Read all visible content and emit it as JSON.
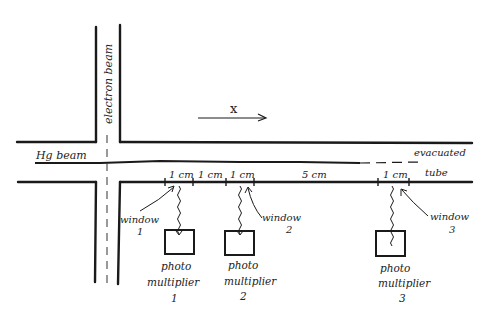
{
  "diagram": {
    "type": "apparatus-sketch",
    "labels": {
      "electron_beam": "electron beam",
      "hg_beam": "Hg beam",
      "direction": "x",
      "evacuated": "evacuated",
      "tube": "tube"
    },
    "distances": [
      {
        "label": "1 cm"
      },
      {
        "label": "1 cm"
      },
      {
        "label": "1 cm"
      },
      {
        "label": "5 cm"
      },
      {
        "label": "1 cm"
      }
    ],
    "windows": [
      {
        "label": "window",
        "num": "1"
      },
      {
        "label": "window",
        "num": "2"
      },
      {
        "label": "window",
        "num": "3"
      }
    ],
    "photomultipliers": [
      {
        "line1": "photo",
        "line2": "multiplier",
        "num": "1"
      },
      {
        "line1": "photo",
        "line2": "multiplier",
        "num": "2"
      },
      {
        "line1": "photo",
        "line2": "multiplier",
        "num": "3"
      }
    ],
    "colors": {
      "ink": "#1a1a1a",
      "background": "#ffffff"
    }
  }
}
